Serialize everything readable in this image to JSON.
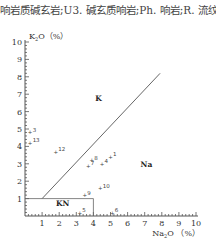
{
  "caption": "响岩质碱玄岩;U3. 碱玄质响岩;Ph. 响岩;R. 流纹",
  "chart_data": {
    "type": "scatter",
    "title": "",
    "xlabel": "Na2O (%)",
    "ylabel": "K2O (%)",
    "xlim": [
      0,
      10
    ],
    "ylim": [
      0,
      10
    ],
    "x_ticks": [
      "1",
      "2",
      "3",
      "4",
      "5",
      "6",
      "7",
      "8",
      "9",
      "10"
    ],
    "y_ticks": [
      "1",
      "2",
      "3",
      "4",
      "5",
      "6",
      "7",
      "8",
      "9",
      "10"
    ],
    "grid": false,
    "fields": [
      {
        "name": "K",
        "x": 4.3,
        "y": 6.6
      },
      {
        "name": "Na",
        "x": 7.1,
        "y": 2.8
      },
      {
        "name": "KN",
        "x": 2.2,
        "y": 0.55
      }
    ],
    "boundaries": [
      {
        "type": "line",
        "from": [
          1,
          1
        ],
        "to": [
          7.9,
          8.2
        ]
      },
      {
        "type": "box",
        "from": [
          0,
          1
        ],
        "to": [
          4,
          0
        ]
      }
    ],
    "points": [
      {
        "label": "1",
        "x": 5.0,
        "y": 3.4
      },
      {
        "label": "3",
        "x": 0.3,
        "y": 4.8
      },
      {
        "label": "4",
        "x": 4.5,
        "y": 3.0
      },
      {
        "label": "5",
        "x": 3.2,
        "y": 0.2
      },
      {
        "label": "6",
        "x": 5.1,
        "y": 0.2
      },
      {
        "label": "7",
        "x": 3.7,
        "y": 2.9
      },
      {
        "label": "8",
        "x": 3.9,
        "y": 3.2
      },
      {
        "label": "9",
        "x": 3.5,
        "y": 1.2
      },
      {
        "label": "10",
        "x": 4.4,
        "y": 1.6
      },
      {
        "label": "12",
        "x": 1.8,
        "y": 3.7
      },
      {
        "label": "13",
        "x": 0.3,
        "y": 4.2
      }
    ]
  }
}
